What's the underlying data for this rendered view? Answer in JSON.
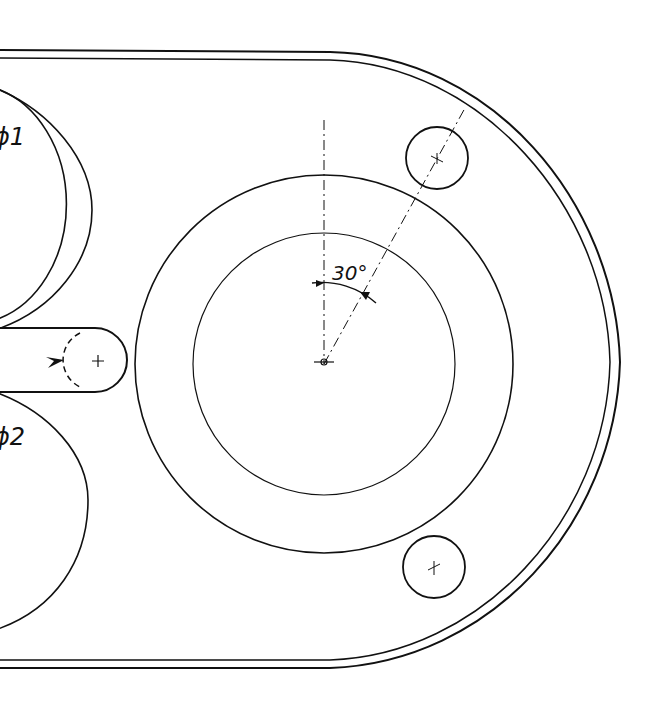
{
  "drawing": {
    "type": "technical-drawing",
    "description": "Mechanical plate with rounded end, large ring, two small holes and slot",
    "labels": {
      "circle_1": "ϕ1",
      "circle_2": "ϕ2",
      "angle": "30°"
    },
    "colors": {
      "line": "#111111",
      "background": "#ffffff"
    }
  }
}
